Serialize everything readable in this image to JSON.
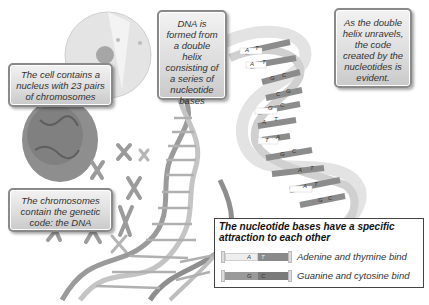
{
  "callouts": {
    "cell": "The cell contains a nucleus with 23 pairs of chromosomes",
    "dna": "DNA is formed from a double helix consisting of a series of nucleotide bases",
    "unravel": "As the double helix unravels, the code created by the nucleotides is evident.",
    "chromosomes": "The chromosomes contain the genetic code: the DNA"
  },
  "legend": {
    "title": "The nucleotide bases have a specific attraction to each other",
    "rows": [
      {
        "left_base": "A",
        "right_base": "T",
        "label": "Adenine and thymine bind",
        "left_color": "#eeeeee",
        "right_color": "#8a8a8a"
      },
      {
        "left_base": "G",
        "right_base": "C",
        "label": "Guanine and cytosine bind",
        "left_color": "#9a9a9a",
        "right_color": "#7a7a7a"
      }
    ]
  },
  "helix_bases": [
    "A",
    "T",
    "A",
    "T",
    "G",
    "C",
    "T",
    "A",
    "C",
    "G",
    "G",
    "C",
    "A",
    "T",
    "T",
    "A",
    "G",
    "C",
    "T",
    "A",
    "G",
    "C",
    "A",
    "T",
    "T",
    "A",
    "G",
    "C"
  ],
  "colors": {
    "ribbon_light": "#e6e6e6",
    "ribbon_dark": "#8c8c8c",
    "box_border": "#8a8a8a",
    "cell": "#d4d4d4",
    "nucleus": "#8e8e8e"
  }
}
